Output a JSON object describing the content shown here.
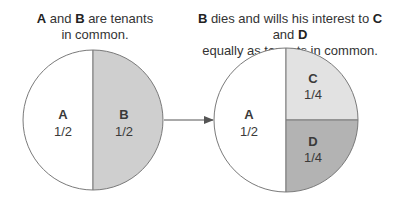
{
  "captions": {
    "left": {
      "p1": "A",
      "p2": " and ",
      "p3": "B",
      "p4": " are tenants",
      "line2": "in common."
    },
    "right": {
      "p1": "B",
      "p2": " dies and wills his interest to ",
      "p3": "C",
      "p4": " and ",
      "p5": "D",
      "line2": "equally as tenants in common."
    }
  },
  "left_circle": {
    "segments": [
      {
        "name": "A",
        "fraction": "1/2",
        "fill": "#ffffff"
      },
      {
        "name": "B",
        "fraction": "1/2",
        "fill": "#cfcfcf"
      }
    ]
  },
  "right_circle": {
    "segments": [
      {
        "name": "A",
        "fraction": "1/2",
        "fill": "#ffffff"
      },
      {
        "name": "C",
        "fraction": "1/4",
        "fill": "#e2e2e2"
      },
      {
        "name": "D",
        "fraction": "1/4",
        "fill": "#b3b3b3"
      }
    ]
  },
  "colors": {
    "outline": "#7a7a7a",
    "arrow": "#555555"
  }
}
